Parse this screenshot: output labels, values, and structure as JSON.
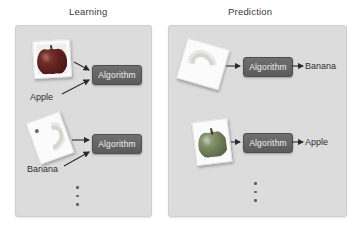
{
  "figure": {
    "type": "diagram"
  },
  "panels": [
    {
      "id": "learning",
      "title": "Learning",
      "rows": [
        {
          "image_icon": "apple-photo-icon",
          "input_label": "Apple",
          "processor_label": "Algorithm",
          "output_label": ""
        },
        {
          "image_icon": "banana-photo-icon",
          "input_label": "Banana",
          "processor_label": "Algorithm",
          "output_label": ""
        }
      ],
      "ellipsis": "vertical-ellipsis-icon"
    },
    {
      "id": "prediction",
      "title": "Prediction",
      "rows": [
        {
          "image_icon": "banana-photo-icon",
          "input_label": "",
          "processor_label": "Algorithm",
          "output_label": "Banana"
        },
        {
          "image_icon": "apple-photo-icon",
          "input_label": "",
          "processor_label": "Algorithm",
          "output_label": "Apple"
        }
      ],
      "ellipsis": "vertical-ellipsis-icon"
    }
  ],
  "colors": {
    "panel_background": "#dcdcdc",
    "algorithm_box": "#646464",
    "algorithm_text": "#f2f2f2",
    "arrow": "#2b2b2b",
    "text": "#2f2f2f",
    "page_background": "#ffffff"
  }
}
